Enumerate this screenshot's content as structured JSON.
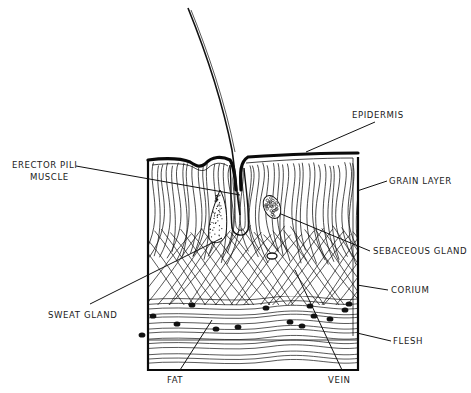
{
  "diagram": {
    "labels": [
      {
        "id": "epidermis",
        "text": "EPIDERMIS",
        "x": 352,
        "y": 118,
        "anchor": "start",
        "leader": [
          [
            375,
            122
          ],
          [
            306,
            152
          ]
        ]
      },
      {
        "id": "grain-layer",
        "text": "GRAIN LAYER",
        "x": 389,
        "y": 184,
        "anchor": "start",
        "leader": [
          [
            387,
            181
          ],
          [
            357,
            191
          ]
        ]
      },
      {
        "id": "erector-pili-line1",
        "text": "ERECTOR PILI",
        "x": 12,
        "y": 168,
        "anchor": "start",
        "leader": [
          [
            76,
            166
          ],
          [
            240,
            195
          ]
        ]
      },
      {
        "id": "erector-pili-line2",
        "text": "MUSCLE",
        "x": 30,
        "y": 180,
        "anchor": "start"
      },
      {
        "id": "sebaceous-gland",
        "text": "SEBACEOUS GLAND",
        "x": 373,
        "y": 254,
        "anchor": "start",
        "leader": [
          [
            370,
            251
          ],
          [
            281,
            214
          ]
        ]
      },
      {
        "id": "corium",
        "text": "CORIUM",
        "x": 391,
        "y": 293,
        "anchor": "start",
        "leader": [
          [
            388,
            290
          ],
          [
            357,
            285
          ]
        ]
      },
      {
        "id": "sweat-gland",
        "text": "SWEAT GLAND",
        "x": 48,
        "y": 318,
        "anchor": "start",
        "leader": [
          [
            90,
            304
          ],
          [
            222,
            238
          ]
        ]
      },
      {
        "id": "flesh",
        "text": "FLESH",
        "x": 393,
        "y": 344,
        "anchor": "start",
        "leader": [
          [
            391,
            341
          ],
          [
            357,
            333
          ]
        ]
      },
      {
        "id": "fat",
        "text": "FAT",
        "x": 167,
        "y": 383,
        "anchor": "start",
        "leader": [
          [
            180,
            370
          ],
          [
            212,
            320
          ]
        ]
      },
      {
        "id": "vein",
        "text": "VEIN",
        "x": 328,
        "y": 383,
        "anchor": "start",
        "leader": [
          [
            342,
            370
          ],
          [
            295,
            270
          ]
        ]
      }
    ],
    "fat_cells": [
      [
        192,
        305
      ],
      [
        153,
        316
      ],
      [
        216,
        329
      ],
      [
        177,
        324
      ],
      [
        142,
        335
      ],
      [
        238,
        327
      ],
      [
        266,
        308
      ],
      [
        290,
        322
      ],
      [
        302,
        326
      ],
      [
        314,
        316
      ],
      [
        345,
        310
      ],
      [
        330,
        319
      ],
      [
        349,
        304
      ],
      [
        310,
        306
      ]
    ],
    "colors": {
      "ink": "#111111",
      "paper": "#ffffff"
    }
  }
}
